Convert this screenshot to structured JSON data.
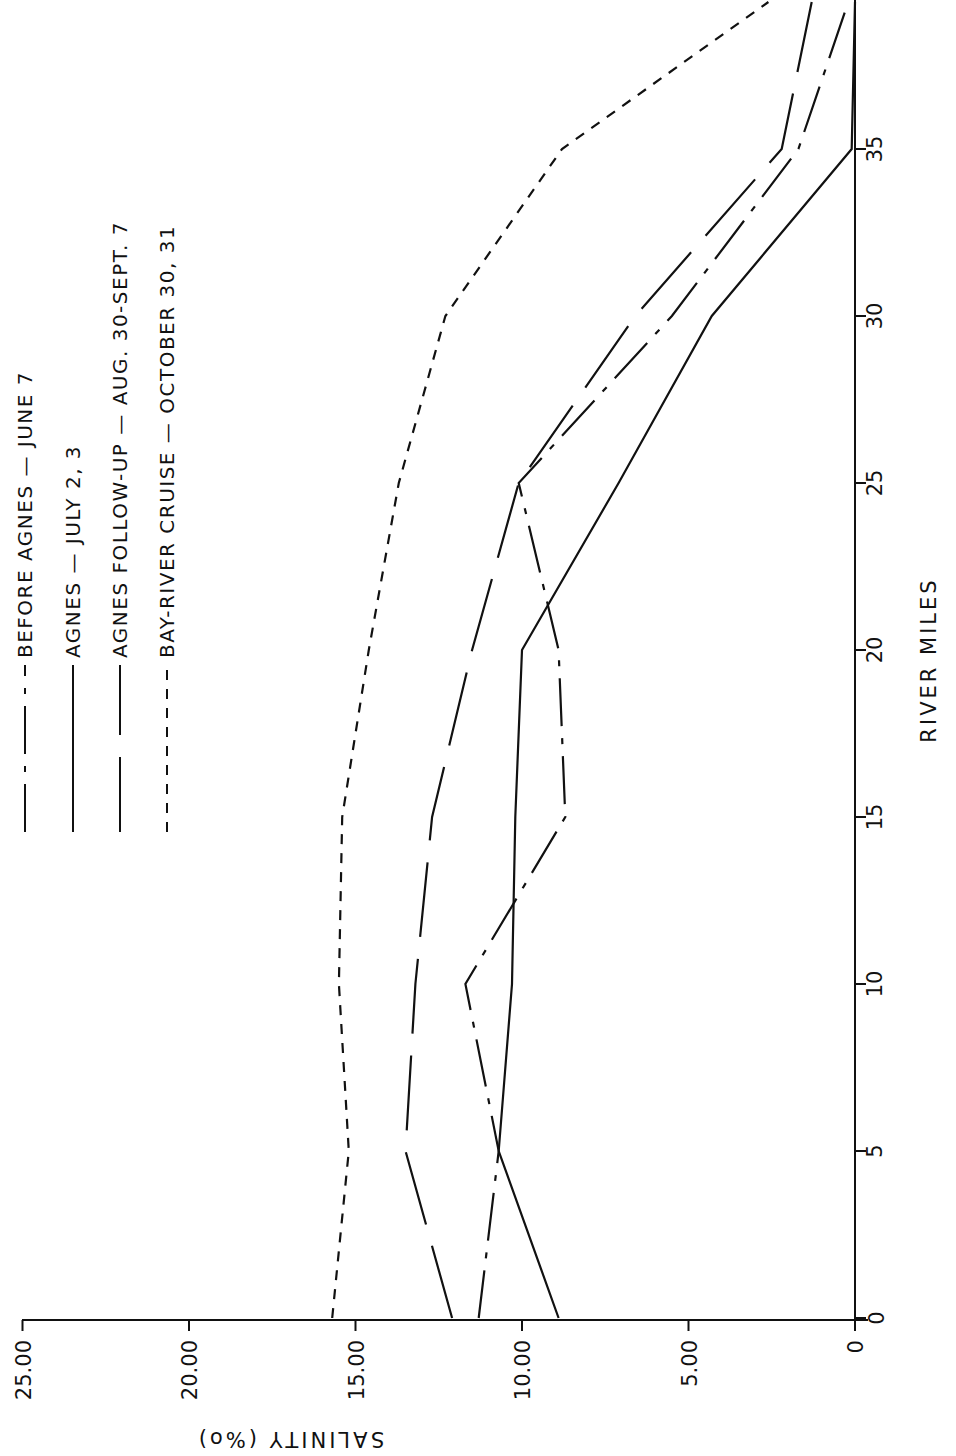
{
  "chart_data": {
    "type": "line",
    "title": "",
    "orientation_note": "figure printed rotated 90 degrees; river miles run vertically, salinity horizontally (increasing leftward)",
    "xlabel": "RIVER MILES",
    "ylabel": "SALINITY (‰)",
    "xlim": [
      0,
      39.4
    ],
    "ylim": [
      0,
      25
    ],
    "x_ticks": [
      "0",
      "5",
      "10",
      "15",
      "20",
      "25",
      "30",
      "35"
    ],
    "y_ticks": [
      "0",
      "5.00",
      "10.00",
      "15.00",
      "20.00",
      "25.00"
    ],
    "grid": false,
    "legend_position": "upper-left (rotated)",
    "x": [
      0,
      5,
      10,
      15,
      20,
      25,
      30,
      35,
      39.4
    ],
    "series": [
      {
        "name": "BEFORE AGNES — JUNE 7",
        "style": "dash-dot",
        "values": [
          11.3,
          10.7,
          11.7,
          8.7,
          8.9,
          10.1,
          5.5,
          1.7,
          0.2
        ]
      },
      {
        "name": "AGNES — JULY 2, 3",
        "style": "solid",
        "values": [
          8.9,
          10.7,
          10.3,
          10.2,
          10.0,
          7.1,
          4.3,
          0.1,
          0.0
        ]
      },
      {
        "name": "AGNES FOLLOW-UP — AUG. 30-SEPT. 7",
        "style": "long-dash",
        "values": [
          12.1,
          13.5,
          13.2,
          12.7,
          11.5,
          10.1,
          6.6,
          2.2,
          1.3
        ]
      },
      {
        "name": "BAY-RIVER CRUISE — OCTOBER 30, 31",
        "style": "short-dash",
        "values": [
          15.7,
          15.2,
          15.5,
          15.4,
          14.6,
          13.7,
          12.3,
          8.8,
          2.6
        ]
      }
    ]
  },
  "axes": {
    "x_title": "RIVER MILES",
    "y_title": "SALINITY (‰)",
    "y_title_display": "SALINITY (%o)",
    "origin_label": "0",
    "x_tick_labels": [
      "5",
      "10",
      "15",
      "20",
      "25",
      "30",
      "35"
    ],
    "y_tick_labels": [
      "25.00",
      "20.00",
      "15.00",
      "10.00",
      "5.00",
      "0"
    ]
  },
  "legend": {
    "items": [
      {
        "label": "BEFORE AGNES — JUNE 7"
      },
      {
        "label": "AGNES — JULY 2, 3"
      },
      {
        "label": "AGNES FOLLOW-UP — AUG. 30-SEPT. 7"
      },
      {
        "label": "BAY-RIVER CRUISE — OCTOBER 30, 31"
      }
    ]
  },
  "colors": {
    "ink": "#111111",
    "background": "#ffffff"
  }
}
